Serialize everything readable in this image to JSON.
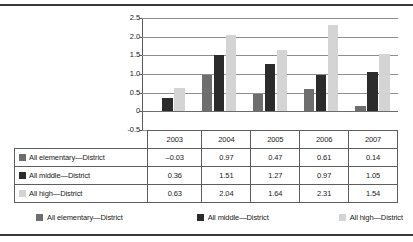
{
  "chart_data": {
    "type": "bar",
    "title": "",
    "xlabel": "",
    "ylabel": "",
    "categories": [
      "2003",
      "2004",
      "2005",
      "2006",
      "2007"
    ],
    "series": [
      {
        "name": "All elementary—District",
        "color": "#6e6e6e",
        "values": [
          -0.03,
          0.97,
          0.47,
          0.61,
          0.14
        ]
      },
      {
        "name": "All middle—District",
        "color": "#2b2b2b",
        "values": [
          0.36,
          1.51,
          1.27,
          0.97,
          1.05
        ]
      },
      {
        "name": "All high—District",
        "color": "#d4d4d4",
        "values": [
          0.63,
          2.04,
          1.64,
          2.31,
          1.54
        ]
      }
    ],
    "ylim": [
      -0.5,
      2.5
    ],
    "yticks": [
      "2.5",
      "2.0",
      "1.5",
      "1.0",
      "0.5",
      "0",
      "-0.5"
    ],
    "ytick_values": [
      2.5,
      2.0,
      1.5,
      1.0,
      0.5,
      0,
      -0.5
    ],
    "grid": true,
    "legend_position": "bottom"
  },
  "table": {
    "year_header": [
      "2003",
      "2004",
      "2005",
      "2006",
      "2007"
    ],
    "rows": [
      {
        "label": "All elementary—District",
        "color": "#6e6e6e",
        "values": [
          "–0.03",
          "0.97",
          "0.47",
          "0.61",
          "0.14"
        ]
      },
      {
        "label": "All middle—District",
        "color": "#2b2b2b",
        "values": [
          "0.36",
          "1.51",
          "1.27",
          "0.97",
          "1.05"
        ]
      },
      {
        "label": "All high—District",
        "color": "#d4d4d4",
        "values": [
          "0.63",
          "2.04",
          "1.64",
          "2.31",
          "1.54"
        ]
      }
    ]
  },
  "legend": {
    "items": [
      {
        "label": "All elementary—District",
        "color": "#6e6e6e"
      },
      {
        "label": "All middle—District",
        "color": "#2b2b2b"
      },
      {
        "label": "All high—District",
        "color": "#d4d4d4"
      }
    ]
  }
}
